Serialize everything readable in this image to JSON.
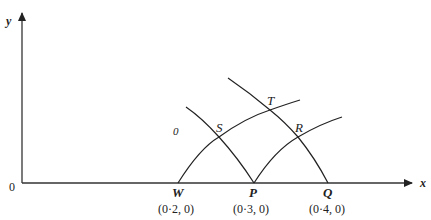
{
  "diagram": {
    "axes": {
      "x_label": "x",
      "y_label": "y",
      "origin_label": "0"
    },
    "region_label": "0",
    "points": {
      "W": {
        "label": "W",
        "coord": "(0·2, 0)"
      },
      "P": {
        "label": "P",
        "coord": "(0·3, 0)"
      },
      "Q": {
        "label": "Q",
        "coord": "(0·4, 0)"
      },
      "S": {
        "label": "S"
      },
      "T": {
        "label": "T"
      },
      "R": {
        "label": "R"
      }
    },
    "curves": [
      {
        "name": "W-S-T",
        "from": "W",
        "through": [
          "S",
          "T"
        ]
      },
      {
        "name": "P-R",
        "from": "P",
        "through": [
          "R"
        ]
      },
      {
        "name": "P-S",
        "from": "P",
        "through": [
          "S"
        ]
      },
      {
        "name": "Q-R-T",
        "from": "Q",
        "through": [
          "R",
          "T"
        ]
      }
    ]
  }
}
